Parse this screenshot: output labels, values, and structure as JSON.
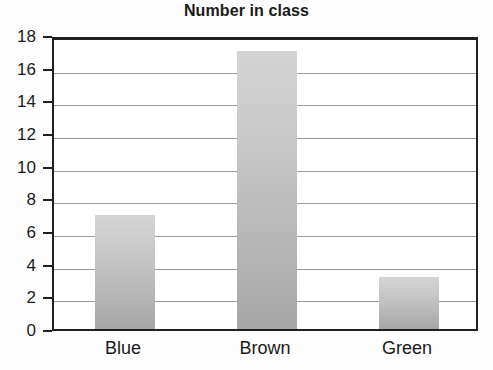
{
  "chart_data": {
    "type": "bar",
    "title": "Number in class",
    "xlabel": "",
    "ylabel": "",
    "categories": [
      "Blue",
      "Brown",
      "Green"
    ],
    "values": [
      7,
      17,
      3.2
    ],
    "ylim": [
      0,
      18
    ],
    "yticks": [
      0,
      2,
      4,
      6,
      8,
      10,
      12,
      14,
      16,
      18
    ],
    "ytick_labels": [
      "0",
      "2",
      "4",
      "6",
      "8",
      "10",
      "12",
      "14",
      "16",
      "18"
    ],
    "grid": true,
    "legend": false,
    "bar_color": "#c2c2c2",
    "axis_color": "#202020",
    "grid_color": "#9a9a9a",
    "text_color": "#1a1a1a"
  }
}
